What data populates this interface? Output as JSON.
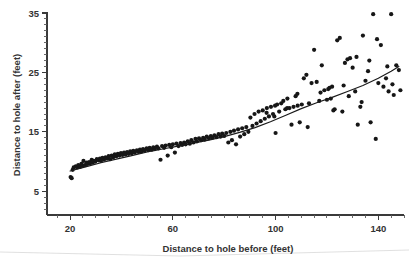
{
  "chart_data": {
    "type": "scatter",
    "title": "",
    "xlabel": "Distance to hole before (feet)",
    "ylabel": "Distance to hole after (feet)",
    "xlim": [
      11,
      150
    ],
    "ylim": [
      1,
      35
    ],
    "grid": false,
    "legend": "none",
    "x_ticks_major": [
      20,
      60,
      100,
      140
    ],
    "x_ticks_major_labels": [
      "20",
      "60",
      "100",
      "140"
    ],
    "x_tick_minor_step": 5,
    "y_ticks_major": [
      5,
      15,
      25,
      35
    ],
    "y_ticks_major_labels": [
      "5",
      "15",
      "25",
      "35"
    ],
    "y_tick_minor_step": 1,
    "point_radius_px": 2.1,
    "point_color": "#161616",
    "line_color": "#1a1a1a",
    "series": [
      {
        "name": "Putts",
        "x": [
          20.2,
          20.6,
          21.0,
          21.4,
          22.2,
          22.8,
          23.2,
          23.8,
          24.4,
          24.8,
          25.2,
          25.8,
          26.4,
          26.8,
          27.4,
          27.8,
          28.4,
          28.8,
          29.2,
          29.8,
          30.4,
          31.0,
          31.6,
          32.0,
          32.6,
          33.2,
          33.8,
          34.4,
          35.0,
          35.6,
          36.2,
          36.8,
          37.4,
          38.0,
          38.6,
          39.2,
          39.8,
          40.4,
          41.0,
          41.6,
          42.2,
          42.8,
          43.4,
          44.0,
          44.6,
          45.2,
          46.0,
          46.6,
          47.2,
          47.8,
          48.4,
          49.0,
          49.8,
          50.4,
          51.0,
          51.8,
          52.4,
          53.0,
          53.8,
          54.4,
          55.2,
          55.8,
          56.6,
          57.2,
          58.0,
          58.6,
          59.4,
          60.0,
          60.8,
          61.4,
          62.2,
          63.0,
          63.6,
          64.4,
          65.0,
          65.8,
          66.6,
          67.2,
          68.0,
          68.8,
          69.4,
          70.2,
          71.0,
          71.8,
          72.4,
          73.2,
          74.0,
          74.8,
          75.4,
          76.2,
          77.0,
          77.8,
          78.6,
          79.2,
          80.0,
          80.8,
          81.6,
          82.4,
          83.0,
          83.8,
          84.6,
          85.4,
          86.2,
          87.0,
          87.8,
          88.6,
          89.4,
          90.2,
          91.0,
          91.8,
          92.6,
          93.4,
          94.2,
          95.0,
          95.8,
          96.6,
          97.4,
          98.2,
          99.0,
          99.8,
          100.0,
          100.6,
          101.4,
          102.2,
          103.0,
          103.8,
          104.6,
          105.4,
          106.2,
          107.0,
          107.8,
          108.6,
          109.4,
          110.2,
          111.0,
          112.0,
          113.0,
          114.0,
          115.0,
          116.0,
          117.0,
          118.0,
          119.0,
          120.0,
          120.5,
          121.0,
          121.5,
          122.0,
          123.0,
          124.0,
          125.0,
          126.0,
          127.0,
          128.0,
          129.0,
          130.0,
          131.0,
          132.0,
          133.0,
          134.0,
          135.0,
          136.0,
          137.0,
          138.0,
          139.0,
          140.0,
          141.0,
          142.0,
          143.0,
          144.0,
          145.0,
          146.0,
          147.0,
          148.0,
          148.6,
          128.5,
          131.5,
          136.5,
          139.5,
          143.5,
          112.5,
          117.5,
          122.5,
          126.5,
          133.5,
          145.5,
          104.5,
          108.5,
          96.5,
          99.5
        ],
        "y": [
          7.4,
          7.2,
          8.6,
          9.0,
          9.2,
          9.0,
          9.4,
          9.1,
          9.6,
          9.3,
          10.1,
          9.4,
          9.8,
          9.6,
          9.9,
          9.7,
          10.3,
          9.8,
          10.1,
          10.0,
          10.4,
          10.2,
          10.5,
          10.1,
          10.6,
          10.3,
          10.7,
          10.5,
          10.9,
          10.4,
          11.0,
          10.7,
          11.2,
          10.9,
          11.3,
          11.0,
          11.4,
          11.1,
          11.5,
          11.2,
          11.6,
          11.3,
          11.7,
          11.4,
          11.8,
          11.5,
          11.9,
          11.6,
          12.0,
          11.7,
          12.1,
          11.8,
          12.2,
          11.9,
          12.3,
          12.0,
          12.4,
          12.1,
          12.5,
          12.2,
          10.3,
          12.6,
          12.3,
          12.7,
          11.0,
          12.8,
          12.4,
          12.9,
          11.5,
          13.0,
          12.6,
          13.1,
          12.8,
          13.2,
          12.9,
          13.4,
          13.0,
          13.6,
          13.2,
          13.8,
          13.4,
          13.9,
          13.6,
          14.0,
          13.7,
          14.2,
          13.9,
          14.3,
          14.0,
          14.4,
          14.1,
          14.6,
          14.2,
          14.7,
          14.3,
          14.8,
          13.2,
          15.0,
          13.6,
          15.2,
          12.9,
          15.4,
          14.2,
          15.6,
          14.6,
          15.8,
          15.0,
          17.4,
          16.0,
          18.0,
          16.4,
          18.4,
          16.8,
          18.6,
          17.2,
          19.0,
          17.6,
          19.2,
          18.0,
          19.4,
          14.8,
          19.6,
          18.4,
          19.8,
          20.2,
          18.8,
          20.6,
          19.0,
          16.2,
          19.2,
          21.0,
          19.4,
          16.6,
          19.6,
          24.0,
          24.6,
          19.8,
          23.2,
          28.8,
          23.4,
          20.2,
          26.2,
          22.0,
          20.4,
          22.2,
          22.4,
          20.6,
          22.6,
          18.8,
          30.4,
          30.8,
          18.4,
          26.6,
          27.2,
          27.4,
          25.8,
          21.8,
          16.2,
          19.2,
          31.2,
          23.6,
          25.2,
          16.6,
          34.8,
          13.8,
          23.2,
          29.6,
          22.6,
          24.0,
          21.8,
          34.8,
          21.2,
          26.2,
          25.4,
          22.0,
          21.0,
          27.6,
          27.0,
          30.6,
          26.0,
          15.8,
          21.6,
          18.6,
          22.8,
          20.0,
          23.0,
          19.0,
          21.4,
          18.2,
          17.6
        ],
        "marker": "filled-circle"
      }
    ],
    "fit_line": {
      "name": "smoothed fit",
      "x": [
        20,
        26,
        32,
        38,
        44,
        50,
        56,
        62,
        68,
        74,
        80,
        86,
        92,
        98,
        104,
        110,
        116,
        122,
        128,
        134,
        140,
        145,
        148
      ],
      "y": [
        8.4,
        9.1,
        9.8,
        10.4,
        11.0,
        11.6,
        12.1,
        12.6,
        13.1,
        13.6,
        14.2,
        14.9,
        15.7,
        16.7,
        17.8,
        18.9,
        19.9,
        20.8,
        21.8,
        22.8,
        24.0,
        25.2,
        26.0
      ]
    }
  }
}
